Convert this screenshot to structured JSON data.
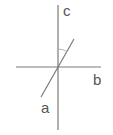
{
  "diagram": {
    "labels": {
      "a": "a",
      "b": "b",
      "c": "c"
    },
    "lines": {
      "a": {
        "x1": 41,
        "y1": 97,
        "x2": 74,
        "y2": 39
      },
      "b": {
        "x1": 16,
        "y1": 67,
        "x2": 101,
        "y2": 67
      },
      "c": {
        "x1": 58,
        "y1": 5,
        "x2": 58,
        "y2": 130
      }
    },
    "angle_mark": "angle between line c and line a",
    "colors": {
      "line": "#7a7a7a",
      "label": "#555555",
      "arc": "#aaaaaa"
    }
  }
}
